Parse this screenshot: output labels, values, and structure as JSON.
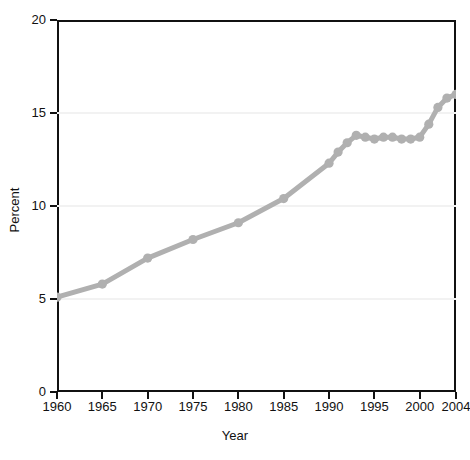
{
  "chart_data": {
    "type": "line",
    "title": "",
    "xlabel": "Year",
    "ylabel": "Percent",
    "xlim": [
      1960,
      2004
    ],
    "ylim": [
      0,
      20
    ],
    "xticks": [
      1960,
      1965,
      1970,
      1975,
      1980,
      1985,
      1990,
      1995,
      2000,
      2004
    ],
    "yticks": [
      0,
      5,
      10,
      15,
      20
    ],
    "grid": "horizontal",
    "legend": "none",
    "line_color": "#b0b0b0",
    "marker_color": "#b0b0b0",
    "axis_color": "#111111",
    "series": [
      {
        "name": "Percent",
        "x": [
          1960,
          1965,
          1970,
          1975,
          1980,
          1985,
          1990,
          1991,
          1992,
          1993,
          1994,
          1995,
          1996,
          1997,
          1998,
          1999,
          2000,
          2001,
          2002,
          2003,
          2004
        ],
        "values": [
          5.1,
          5.8,
          7.2,
          8.2,
          9.1,
          10.4,
          12.3,
          12.9,
          13.4,
          13.8,
          13.7,
          13.6,
          13.7,
          13.7,
          13.6,
          13.6,
          13.7,
          14.4,
          15.3,
          15.8,
          16.0
        ]
      }
    ]
  },
  "axis": {
    "ytick_labels": [
      "20",
      "15",
      "10",
      "5",
      "0"
    ],
    "xtick_labels": [
      "1960",
      "1965",
      "1970",
      "1975",
      "1980",
      "1985",
      "1990",
      "1995",
      "2000",
      "2004"
    ],
    "ylabel_text": "Percent",
    "xlabel_text": "Year"
  }
}
